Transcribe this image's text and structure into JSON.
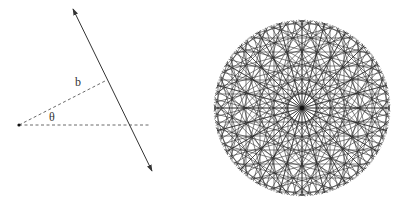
{
  "colors": {
    "background": "#ffffff",
    "line": "#333333",
    "dash": "#444444",
    "pattern": "#2a2a2a"
  },
  "left_diagram": {
    "origin_point": {
      "x": 19,
      "y": 125,
      "r": 1.6
    },
    "main_line": {
      "x1": 73,
      "y1": 9,
      "x2": 152,
      "y2": 171,
      "arrowheads": "both"
    },
    "b_segment": {
      "x1": 19,
      "y1": 125,
      "x2": 107,
      "y2": 80,
      "style": "dashed"
    },
    "horizontal_segment": {
      "x1": 19,
      "y1": 125,
      "x2": 151,
      "y2": 125,
      "style": "dashed"
    },
    "labels": {
      "b": {
        "text": "b",
        "x": 75,
        "y": 86
      },
      "theta": {
        "text": "θ",
        "x": 49,
        "y": 121
      }
    }
  },
  "right_pattern": {
    "center": {
      "x": 302,
      "y": 108
    },
    "radius": 88,
    "angle_count": 24,
    "offsets": [
      0,
      14,
      28,
      42,
      56,
      70,
      84
    ],
    "half_length": 88,
    "stroke_width": 0.7,
    "center_dot_r": 2.2
  }
}
